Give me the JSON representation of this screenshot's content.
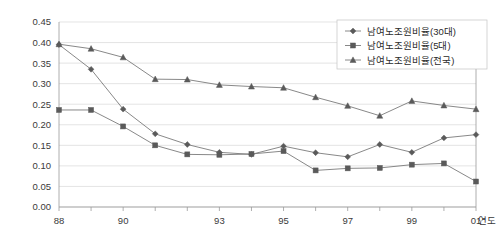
{
  "chart_data": {
    "type": "line",
    "title": "",
    "xlabel": "연도",
    "ylabel": "",
    "ylim": [
      0.0,
      0.45
    ],
    "ytick_labels": [
      "0.00",
      "0.05",
      "0.10",
      "0.15",
      "0.20",
      "0.25",
      "0.30",
      "0.35",
      "0.40",
      "0.45"
    ],
    "ytick_values": [
      0.0,
      0.05,
      0.1,
      0.15,
      0.2,
      0.25,
      0.3,
      0.35,
      0.4,
      0.45
    ],
    "x": [
      88,
      89,
      90,
      91,
      92,
      93,
      94,
      95,
      96,
      97,
      98,
      99,
      100,
      101
    ],
    "xtick_labels": [
      "88",
      "90",
      "93",
      "95",
      "97",
      "99",
      "01"
    ],
    "xtick_values": [
      88,
      90,
      93,
      95,
      97,
      99,
      101
    ],
    "grid": true,
    "legend_position": "top-right",
    "series": [
      {
        "name": "남여노조원비율(30대)",
        "marker": "diamond",
        "values": [
          0.395,
          0.335,
          0.238,
          0.178,
          0.152,
          0.133,
          0.128,
          0.148,
          0.132,
          0.122,
          0.152,
          0.133,
          0.168,
          0.176
        ]
      },
      {
        "name": "남여노조원비율(5대)",
        "marker": "square",
        "values": [
          0.236,
          0.236,
          0.196,
          0.15,
          0.128,
          0.127,
          0.129,
          0.136,
          0.089,
          0.094,
          0.095,
          0.103,
          0.106,
          0.062
        ]
      },
      {
        "name": "남여노조원비율(전국)",
        "marker": "triangle",
        "values": [
          0.396,
          0.385,
          0.364,
          0.311,
          0.31,
          0.297,
          0.293,
          0.29,
          0.267,
          0.246,
          0.222,
          0.258,
          0.247,
          0.238
        ]
      }
    ]
  },
  "legend": {
    "entries": [
      {
        "label": "남여노조원비율(30대)"
      },
      {
        "label": "남여노조원비율(5대)"
      },
      {
        "label": "남여노조원비율(전국)"
      }
    ]
  }
}
